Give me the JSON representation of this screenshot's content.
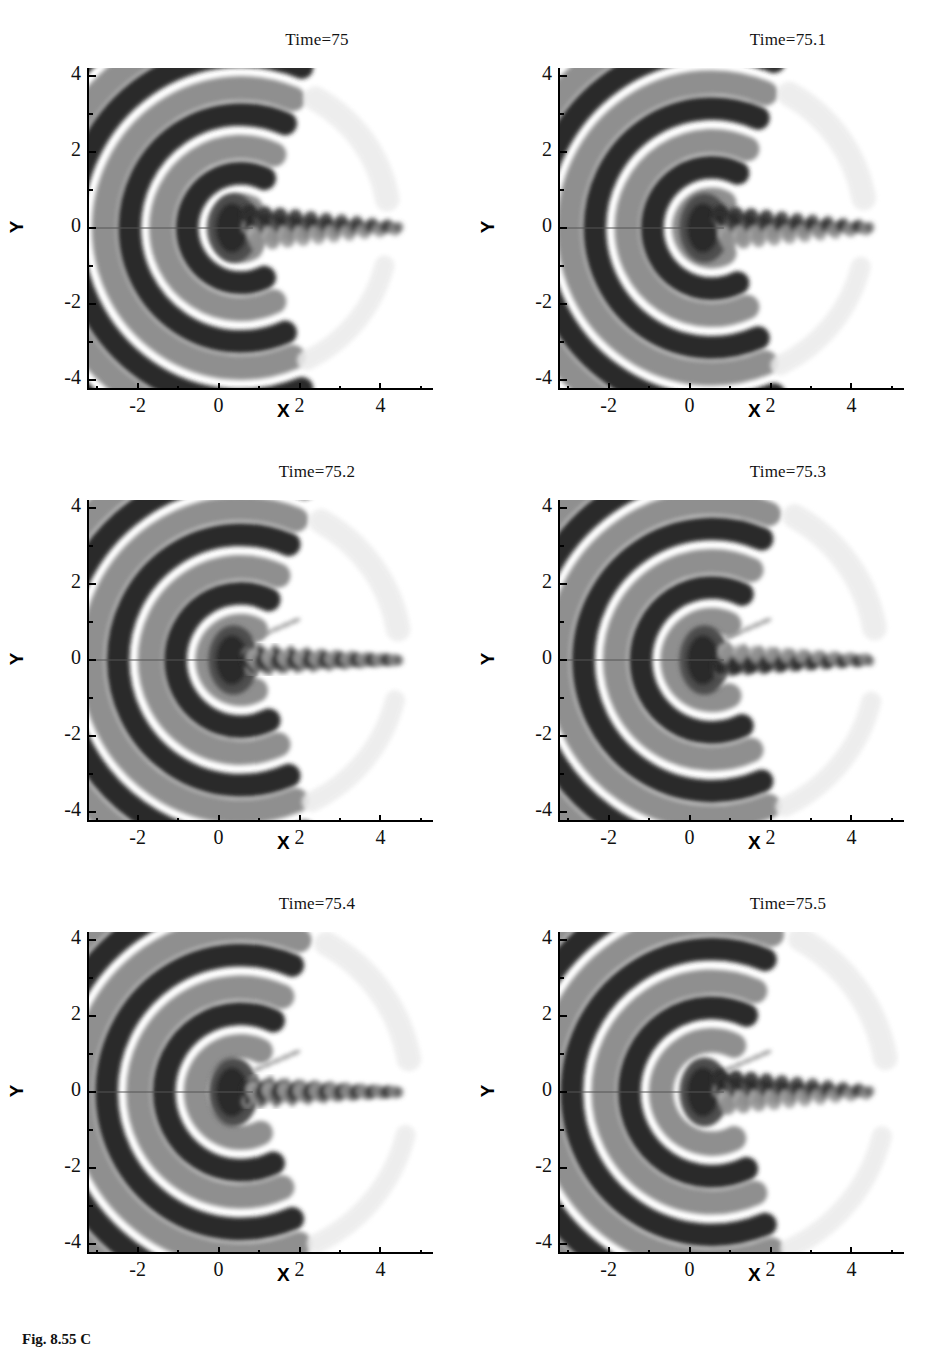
{
  "figure": {
    "caption": "Fig. 8.55  C",
    "panel_count": 6,
    "colormap": "greyscale",
    "colors": {
      "dark": "#2b2b2b",
      "mid_dark": "#4e4e4e",
      "mid": "#8f8f8f",
      "mid_light": "#b4b4b4",
      "light": "#d6d6d6",
      "faint": "#ebebeb",
      "white": "#ffffff",
      "axis": "#000000"
    }
  },
  "axes": {
    "x": {
      "label": "X",
      "ticks": [
        "-2",
        "0",
        "2",
        "4"
      ],
      "tick_values": [
        -2,
        0,
        2,
        4
      ],
      "range": [
        -3.2,
        5.2
      ],
      "minor_per_interval": 1
    },
    "y": {
      "label": "Y",
      "ticks": [
        "4",
        "2",
        "0",
        "-2",
        "-4"
      ],
      "tick_values": [
        4,
        2,
        0,
        -2,
        -4
      ],
      "range": [
        -4.2,
        4.2
      ],
      "minor_per_interval": 1
    }
  },
  "panels": [
    {
      "title": "Time=75",
      "time": 75.0,
      "phase": 0.0
    },
    {
      "title": "Time=75.1",
      "time": 75.1,
      "phase": 0.1
    },
    {
      "title": "Time=75.2",
      "time": 75.2,
      "phase": 0.2
    },
    {
      "title": "Time=75.3",
      "time": 75.3,
      "phase": 0.3
    },
    {
      "title": "Time=75.4",
      "time": 75.4,
      "phase": 0.4
    },
    {
      "title": "Time=75.5",
      "time": 75.5,
      "phase": 0.5
    }
  ],
  "chart_data": {
    "type": "heatmap",
    "xlabel": "X",
    "ylabel": "Y",
    "xlim": [
      -3.2,
      5.2
    ],
    "ylim": [
      -4.2,
      4.2
    ],
    "xticks": [
      -2,
      0,
      2,
      4
    ],
    "yticks": [
      -4,
      -2,
      0,
      2,
      4
    ],
    "grid": false,
    "legend": "none",
    "panel_titles": [
      "Time=75",
      "Time=75.1",
      "Time=75.2",
      "Time=75.3",
      "Time=75.4",
      "Time=75.5"
    ],
    "panel_times": [
      75.0,
      75.1,
      75.2,
      75.3,
      75.4,
      75.5
    ],
    "contour_levels": [
      "dark",
      "mid-dark",
      "mid",
      "light",
      "faint",
      "white"
    ],
    "field_description": "Alternating dark and light circular-arc acoustic wave fronts centred near (0.5, 0), opening upstream, with a thin oscillating zigzag wake of alternating dark/light vortex blobs extending downstream along Y=0 from X~0.7 to X~4.3",
    "wave_source": [
      0.5,
      0.0
    ],
    "wake_axis_y": 0.0,
    "wake_x_start": 0.7,
    "wake_x_end": 4.4,
    "wake_wavelength": 0.38,
    "wake_amplitude": 0.28,
    "radial_wavelength": 1.45,
    "n_wavefronts": 3
  }
}
